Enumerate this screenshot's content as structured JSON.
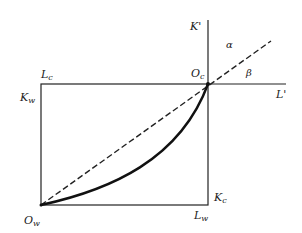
{
  "diagram": {
    "type": "edgeworth-box",
    "colors": {
      "ink": "#222222",
      "background": "#ffffff"
    },
    "labels": {
      "K_prime": {
        "main": "K",
        "sup": "'"
      },
      "L_prime": {
        "main": "L",
        "sup": "'"
      },
      "alpha": "α",
      "beta": "β",
      "O_c": {
        "main": "O",
        "sub": "c"
      },
      "O_w": {
        "main": "O",
        "sub": "w"
      },
      "L_c": {
        "main": "L",
        "sub": "c"
      },
      "K_w": {
        "main": "K",
        "sub": "w"
      },
      "K_c": {
        "main": "K",
        "sub": "c"
      },
      "L_w": {
        "main": "L",
        "sub": "w"
      }
    },
    "box": {
      "left": 41,
      "top": 84,
      "right": 208,
      "bottom": 205
    },
    "axes": {
      "K_prime_axis": {
        "x": 208,
        "y_top": 20,
        "y_bottom": 205
      },
      "L_prime_axis": {
        "y": 84,
        "x_left": 41,
        "x_right": 286
      }
    },
    "dashed_line": {
      "from": [
        41,
        205
      ],
      "to": [
        271,
        41
      ]
    },
    "contract_curve": {
      "from": [
        41,
        205
      ],
      "to": [
        208,
        84
      ],
      "shape": "convex"
    }
  }
}
